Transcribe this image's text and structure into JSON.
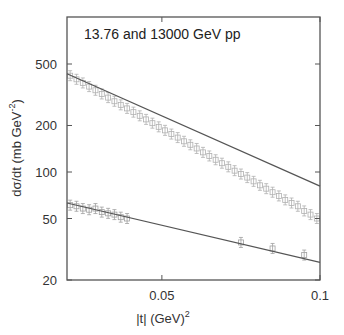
{
  "chart_data": {
    "type": "scatter",
    "title": "",
    "annotation": "13.76 and 13000 GeV pp",
    "xlabel": "|t| (GeV)",
    "xlabel_sup": "2",
    "ylabel": "dσ/dt (mb GeV",
    "ylabel_sup": "-2",
    "ylabel_close": ")",
    "xlim": [
      0.02,
      0.1
    ],
    "ylim": [
      20,
      600
    ],
    "yscale": "log",
    "xticks": [
      {
        "value": 0.05,
        "label": "0.05"
      },
      {
        "value": 0.1,
        "label": "0.1"
      }
    ],
    "yticks": [
      {
        "value": 20,
        "label": "20"
      },
      {
        "value": 50,
        "label": "50"
      },
      {
        "value": 100,
        "label": "100"
      },
      {
        "value": 200,
        "label": "200"
      },
      {
        "value": 500,
        "label": "500"
      }
    ],
    "grid": false,
    "legend": null,
    "series": [
      {
        "name": "13000 GeV pp data",
        "marker": "square-open",
        "color": "#b0b0b0",
        "x": [
          0.021,
          0.023,
          0.025,
          0.027,
          0.029,
          0.031,
          0.033,
          0.035,
          0.037,
          0.039,
          0.041,
          0.043,
          0.045,
          0.047,
          0.049,
          0.051,
          0.053,
          0.055,
          0.057,
          0.059,
          0.061,
          0.063,
          0.065,
          0.067,
          0.069,
          0.071,
          0.073,
          0.075,
          0.077,
          0.079,
          0.081,
          0.083,
          0.085,
          0.087,
          0.089,
          0.091,
          0.093,
          0.095,
          0.097,
          0.099
        ],
        "y": [
          420,
          398,
          377,
          357,
          338,
          320,
          303,
          287,
          272,
          258,
          244,
          231,
          219,
          207,
          196,
          186,
          176,
          167,
          158,
          150,
          142,
          134,
          127,
          120,
          114,
          108,
          102,
          97,
          92,
          87,
          82,
          78,
          74,
          70,
          66,
          63,
          60,
          56,
          53,
          50
        ]
      },
      {
        "name": "13000 GeV pp fit",
        "type": "line",
        "color": "#555555",
        "x": [
          0.02,
          0.1
        ],
        "y": [
          432,
          81
        ]
      },
      {
        "name": "13.76 GeV pp data",
        "marker": "square-open",
        "color": "#a0a0a0",
        "x": [
          0.021,
          0.023,
          0.025,
          0.027,
          0.029,
          0.031,
          0.033,
          0.035,
          0.037,
          0.039,
          0.075,
          0.085,
          0.095
        ],
        "y": [
          61,
          60,
          58,
          57,
          58,
          55,
          54,
          53,
          51,
          50,
          35,
          32,
          29
        ]
      },
      {
        "name": "13.76 GeV pp fit",
        "type": "line",
        "color": "#555555",
        "x": [
          0.02,
          0.1
        ],
        "y": [
          63,
          26
        ]
      }
    ]
  }
}
